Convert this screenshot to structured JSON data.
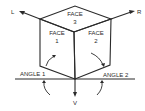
{
  "diagram": {
    "type": "isometric-cube-projection",
    "faces": [
      {
        "id": "face3",
        "title": "FACE",
        "number": "3"
      },
      {
        "id": "face1",
        "title": "FACE",
        "number": "1"
      },
      {
        "id": "face2",
        "title": "FACE",
        "number": "2"
      }
    ],
    "axes": {
      "left": "L",
      "right": "R",
      "vertical": "V"
    },
    "angles": [
      {
        "id": "angle1",
        "label": "ANGLE 1"
      },
      {
        "id": "angle2",
        "label": "ANGLE 2"
      }
    ],
    "colors": {
      "stroke": "#2a2a2a",
      "background": "#ffffff"
    }
  }
}
